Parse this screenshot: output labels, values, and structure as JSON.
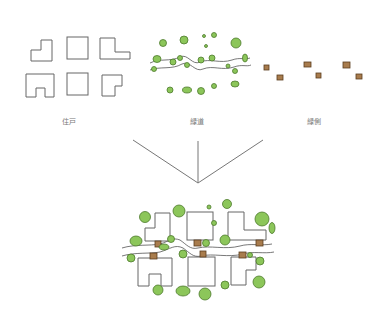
{
  "diagram": {
    "title": "",
    "components": [
      {
        "id": "units",
        "label": "住戸"
      },
      {
        "id": "greenway",
        "label": "緑道"
      },
      {
        "id": "edge",
        "label": "緑側"
      }
    ],
    "relation": "three components combine into one composite layout",
    "colors": {
      "tree_fill": "#8cc65a",
      "tree_stroke": "#4d7a2c",
      "box_fill": "#a87c4d",
      "outline": "#666666"
    }
  }
}
